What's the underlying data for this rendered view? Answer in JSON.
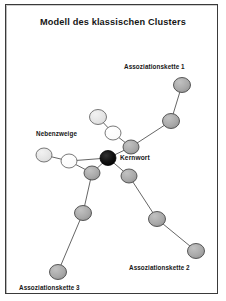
{
  "figure": {
    "title": "Modell des klassischen Clusters",
    "language": "de",
    "border_color": "#3a3a3a",
    "background": "#ffffff"
  },
  "labels": {
    "title": "Modell des klassischen Clusters",
    "kernwort": "Kernwort",
    "nebenzweige": "Nebenzweige",
    "kette1": "Assoziationskette 1",
    "kette2": "Assoziationskette 2",
    "kette3": "Assoziationskette 3"
  },
  "chart_data": {
    "type": "diagram",
    "diagram_kind": "node-link cluster / mind-map",
    "title": "Modell des klassischen Clusters",
    "annotations": [
      {
        "text": "Modell des klassischen Clusters",
        "x": 113,
        "y": 22,
        "role": "title"
      },
      {
        "text": "Assoziationskette 1",
        "x": 124,
        "y": 67,
        "role": "branch-label"
      },
      {
        "text": "Nebenzweige",
        "x": 36,
        "y": 134,
        "role": "branch-label"
      },
      {
        "text": "Kernwort",
        "x": 120,
        "y": 158,
        "role": "node-label"
      },
      {
        "text": "Assoziationskette 2",
        "x": 129,
        "y": 268,
        "role": "branch-label"
      },
      {
        "text": "Assoziationskette 3",
        "x": 19,
        "y": 288,
        "role": "branch-label"
      }
    ],
    "node_styles": {
      "core": {
        "fill": "#111111",
        "stroke": "#000000",
        "label": "Kernwort"
      },
      "chain": {
        "fill": "#a8a8a8",
        "stroke": "#4a4a4a"
      },
      "light": {
        "fill": "#e2e2e2",
        "stroke": "#6a6a6a"
      },
      "white": {
        "fill": "#fbfbfb",
        "stroke": "#6a6a6a"
      }
    },
    "nodes": [
      {
        "id": "core",
        "x": 108,
        "y": 158,
        "rx": 8.0,
        "ry": 7.5,
        "style": "core",
        "branch": "center"
      },
      {
        "id": "a1_1",
        "x": 131,
        "y": 147,
        "rx": 8.0,
        "ry": 7.0,
        "style": "chain",
        "branch": "kette1"
      },
      {
        "id": "a1_2",
        "x": 171,
        "y": 121,
        "rx": 8.5,
        "ry": 7.5,
        "style": "chain",
        "branch": "kette1"
      },
      {
        "id": "a1_3",
        "x": 182,
        "y": 85,
        "rx": 8.5,
        "ry": 7.5,
        "style": "chain",
        "branch": "kette1"
      },
      {
        "id": "a2_1",
        "x": 129,
        "y": 176,
        "rx": 8.0,
        "ry": 7.0,
        "style": "chain",
        "branch": "kette2"
      },
      {
        "id": "a2_2",
        "x": 157,
        "y": 219,
        "rx": 8.5,
        "ry": 7.5,
        "style": "chain",
        "branch": "kette2"
      },
      {
        "id": "a2_3",
        "x": 196,
        "y": 251,
        "rx": 8.5,
        "ry": 7.5,
        "style": "chain",
        "branch": "kette2"
      },
      {
        "id": "a3_1",
        "x": 92,
        "y": 173,
        "rx": 8.0,
        "ry": 7.0,
        "style": "chain",
        "branch": "kette3"
      },
      {
        "id": "a3_2",
        "x": 83,
        "y": 213,
        "rx": 8.5,
        "ry": 7.5,
        "style": "chain",
        "branch": "kette3"
      },
      {
        "id": "a3_3",
        "x": 58,
        "y": 272,
        "rx": 8.5,
        "ry": 7.5,
        "style": "chain",
        "branch": "kette3"
      },
      {
        "id": "nb_1",
        "x": 69,
        "y": 161,
        "rx": 8.0,
        "ry": 7.0,
        "style": "white",
        "branch": "nebenzweige"
      },
      {
        "id": "nb_2",
        "x": 44,
        "y": 155,
        "rx": 8.0,
        "ry": 7.0,
        "style": "light",
        "branch": "nebenzweige"
      },
      {
        "id": "nb_3",
        "x": 113,
        "y": 133,
        "rx": 8.0,
        "ry": 7.0,
        "style": "white",
        "branch": "nebenzweige"
      },
      {
        "id": "nb_4",
        "x": 98,
        "y": 117,
        "rx": 8.5,
        "ry": 7.5,
        "style": "light",
        "branch": "nebenzweige"
      }
    ],
    "edges": [
      {
        "from": "core",
        "to": "a1_1"
      },
      {
        "from": "a1_1",
        "to": "a1_2"
      },
      {
        "from": "a1_2",
        "to": "a1_3"
      },
      {
        "from": "core",
        "to": "a2_1"
      },
      {
        "from": "a2_1",
        "to": "a2_2"
      },
      {
        "from": "a2_2",
        "to": "a2_3"
      },
      {
        "from": "core",
        "to": "a3_1"
      },
      {
        "from": "a3_1",
        "to": "a3_2"
      },
      {
        "from": "a3_2",
        "to": "a3_3"
      },
      {
        "from": "core",
        "to": "nb_1"
      },
      {
        "from": "nb_1",
        "to": "nb_2"
      },
      {
        "from": "a1_1",
        "to": "nb_3"
      },
      {
        "from": "nb_3",
        "to": "nb_4"
      },
      {
        "from": "a3_1",
        "to": "nb_1"
      }
    ],
    "edge_style": {
      "stroke": "#555555",
      "width": 0.9
    },
    "legend": [],
    "grid": false
  }
}
